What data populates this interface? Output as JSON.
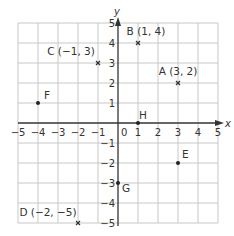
{
  "chart_data": {
    "type": "scatter",
    "title": "",
    "xlabel": "x",
    "ylabel": "y",
    "xlim": [
      -5,
      5
    ],
    "ylim": [
      -5,
      5
    ],
    "grid": true,
    "x_ticks": [
      "−5",
      "−4",
      "−3",
      "−2",
      "−1",
      "0",
      "1",
      "2",
      "3",
      "4",
      "5"
    ],
    "y_ticks": [
      "5",
      "4",
      "3",
      "2",
      "1",
      "−1",
      "−2",
      "−3",
      "−4",
      "−5"
    ],
    "points": [
      {
        "name": "A",
        "label": "A (3, 2)",
        "x": 3,
        "y": 2,
        "marker": "cross"
      },
      {
        "name": "B",
        "label": "B (1, 4)",
        "x": 1,
        "y": 4,
        "marker": "cross"
      },
      {
        "name": "C",
        "label": "C (−1, 3)",
        "x": -1,
        "y": 3,
        "marker": "cross"
      },
      {
        "name": "D",
        "label": "D (−2, −5)",
        "x": -2,
        "y": -5,
        "marker": "cross"
      },
      {
        "name": "E",
        "label": "E",
        "x": 3,
        "y": -2,
        "marker": "dot"
      },
      {
        "name": "F",
        "label": "F",
        "x": -4,
        "y": 1,
        "marker": "dot"
      },
      {
        "name": "G",
        "label": "G",
        "x": 0,
        "y": -3,
        "marker": "dot"
      },
      {
        "name": "H",
        "label": "H",
        "x": 1,
        "y": 0,
        "marker": "dot"
      }
    ]
  },
  "colors": {
    "grid": "#c8c8c8",
    "axis": "#333333",
    "text": "#333333"
  }
}
